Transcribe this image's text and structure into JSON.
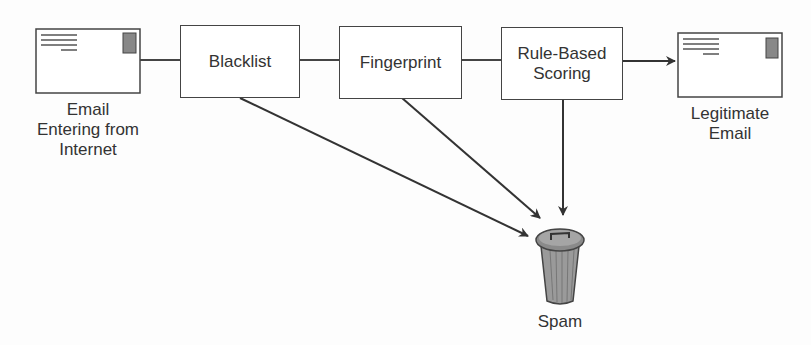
{
  "diagram": {
    "type": "flowchart",
    "nodes": {
      "input": {
        "label": "Email Entering from Internet",
        "icon": "envelope-icon"
      },
      "blacklist": {
        "label": "Blacklist"
      },
      "fingerprint": {
        "label": "Fingerprint"
      },
      "rule_based": {
        "label": "Rule-Based Scoring"
      },
      "legit": {
        "label": "Legitimate Email",
        "icon": "envelope-icon"
      },
      "spam": {
        "label": "Spam",
        "icon": "trash-can-icon"
      }
    },
    "edges": [
      {
        "from": "input",
        "to": "blacklist"
      },
      {
        "from": "blacklist",
        "to": "fingerprint"
      },
      {
        "from": "fingerprint",
        "to": "rule_based"
      },
      {
        "from": "rule_based",
        "to": "legit"
      },
      {
        "from": "blacklist",
        "to": "spam"
      },
      {
        "from": "fingerprint",
        "to": "spam"
      },
      {
        "from": "rule_based",
        "to": "spam"
      }
    ],
    "labels": {
      "input_line1": "Email",
      "input_line2": "Entering from",
      "input_line3": "Internet",
      "blacklist": "Blacklist",
      "fingerprint": "Fingerprint",
      "rule_line1": "Rule-Based",
      "rule_line2": "Scoring",
      "legit_line1": "Legitimate",
      "legit_line2": "Email",
      "spam": "Spam"
    }
  }
}
